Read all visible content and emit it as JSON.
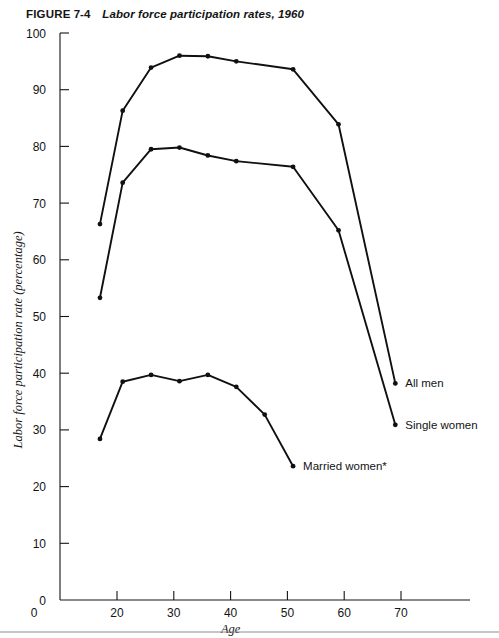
{
  "figure": {
    "label": "FIGURE",
    "number": "7-4",
    "title": "Labor force participation rates, 1960"
  },
  "chart_data": {
    "type": "line",
    "title": "Labor force participation rates, 1960",
    "xlabel": "Age",
    "ylabel": "Labor force participation rate (percentage)",
    "xlim": [
      0,
      75
    ],
    "ylim": [
      0,
      100
    ],
    "grid": false,
    "legend_position": "inline-right",
    "xticks": [
      0,
      20,
      30,
      40,
      50,
      60,
      70
    ],
    "yticks": [
      0,
      10,
      20,
      30,
      40,
      50,
      60,
      70,
      80,
      90,
      100
    ],
    "series": [
      {
        "name": "All men",
        "label": "All men",
        "x": [
          17,
          21,
          26,
          31,
          36,
          41,
          51,
          59,
          69
        ],
        "y": [
          66.3,
          86.3,
          93.9,
          96.0,
          95.9,
          95.0,
          93.6,
          83.9,
          38.2
        ]
      },
      {
        "name": "Single women",
        "label": "Single women",
        "x": [
          17,
          21,
          26,
          31,
          36,
          41,
          51,
          59,
          69
        ],
        "y": [
          53.3,
          73.6,
          79.5,
          79.8,
          78.4,
          77.4,
          76.4,
          65.2,
          30.9
        ]
      },
      {
        "name": "Married women",
        "label": "Married women*",
        "x": [
          17,
          21,
          26,
          31,
          36,
          41,
          46,
          51
        ],
        "y": [
          28.4,
          38.5,
          39.7,
          38.6,
          39.7,
          37.6,
          32.7,
          23.6
        ]
      }
    ],
    "annotations": [
      {
        "text": "All men",
        "x": 69,
        "y": 38.2
      },
      {
        "text": "Single women",
        "x": 69,
        "y": 30.9
      },
      {
        "text": "Married women*",
        "x": 51,
        "y": 23.6
      }
    ]
  }
}
